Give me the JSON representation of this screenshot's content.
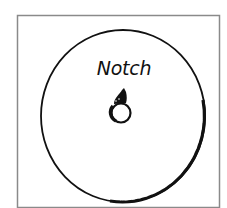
{
  "diagram": {
    "type": "disc-with-notch",
    "labels": {
      "notch": "Notch"
    },
    "colors": {
      "frame": "#8a8a8a",
      "ink": "#111111",
      "background": "#ffffff"
    }
  }
}
